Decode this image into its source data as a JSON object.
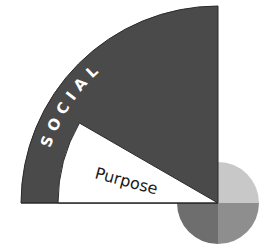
{
  "diagram": {
    "outer_ring_label": "SOCIAL",
    "inner_wedge_label": "Purpose",
    "colors": {
      "ring_fill": "#4a4a4a",
      "wedge_fill": "#ffffff",
      "ring_text": "#ffffff",
      "wedge_text": "#1a1a1a",
      "circle_top_right": "#c8c8c8",
      "circle_bottom_right": "#8e8e8e",
      "circle_bottom_left": "#6e6e6e"
    }
  }
}
